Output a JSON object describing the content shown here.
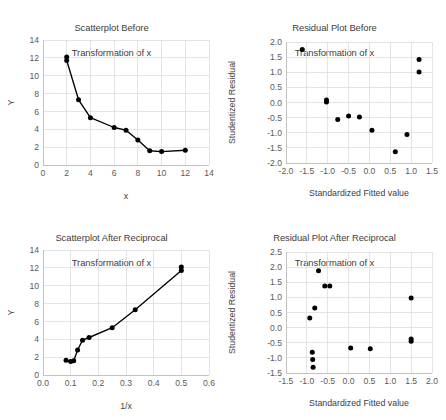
{
  "figure": {
    "width": 446,
    "height": 420,
    "background": "#ffffff",
    "marker_color": "#000000",
    "grid_color": "#d9d9d9",
    "text_color": "#404040"
  },
  "panels": {
    "top_left": {
      "title": "Scatterplot Before\nTransformation of x",
      "title_line1": "Scatterplot Before",
      "title_line2": "Transformation of x"
    },
    "top_right": {
      "title": "Residual Plot Before\nTransformation of x",
      "title_line1": "Residual Plot Before",
      "title_line2": "Transformation of x"
    },
    "bottom_left": {
      "title": "Scatterplot After Reciprocal\nTransformation of x",
      "title_line1": "Scatterplot After Reciprocal",
      "title_line2": "Transformation of x"
    },
    "bottom_right": {
      "title": "Residual Plot After Reciprocal\nTransformation of x",
      "title_line1": "Residual Plot After Reciprocal",
      "title_line2": "Transformation of x"
    }
  },
  "chart_data": [
    {
      "id": "scatterplot-before",
      "type": "line",
      "title": "Scatterplot Before Transformation of x",
      "xlabel": "x",
      "ylabel": "Y",
      "xlim": [
        0,
        14
      ],
      "ylim": [
        0,
        14
      ],
      "xticks": [
        0,
        2,
        4,
        6,
        8,
        10,
        12,
        14
      ],
      "xtick_labels": [
        "0",
        "2",
        "4",
        "6",
        "8",
        "10",
        "12",
        "14"
      ],
      "yticks": [
        0,
        2,
        4,
        6,
        8,
        10,
        12,
        14
      ],
      "ytick_labels": [
        "0",
        "2",
        "4",
        "6",
        "8",
        "10",
        "12",
        "14"
      ],
      "grid": true,
      "legend": "none",
      "markers": true,
      "connected": true,
      "x": [
        2,
        2,
        3,
        4,
        6,
        7,
        8,
        9,
        10,
        12
      ],
      "y": [
        12.1,
        11.7,
        7.3,
        5.3,
        4.2,
        3.9,
        2.8,
        1.6,
        1.5,
        1.65
      ]
    },
    {
      "id": "residual-plot-before",
      "type": "scatter",
      "title": "Residual Plot Before Transformation of x",
      "xlabel": "Standardized Fitted value",
      "ylabel": "Studentized Residual",
      "xlim": [
        -2.0,
        1.5
      ],
      "ylim": [
        -2.0,
        2.0
      ],
      "xticks": [
        -2.0,
        -1.5,
        -1.0,
        -0.5,
        0.0,
        0.5,
        1.0,
        1.5
      ],
      "xtick_labels": [
        "-2.0",
        "-1.5",
        "-1.0",
        "-0.5",
        "0.0",
        "0.5",
        "1.0",
        "1.5"
      ],
      "yticks": [
        -2.0,
        -1.5,
        -1.0,
        -0.5,
        0.0,
        0.5,
        1.0,
        1.5,
        2.0
      ],
      "ytick_labels": [
        "-2.0",
        "-1.5",
        "-1.0",
        "-0.5",
        "0.0",
        "0.5",
        "1.0",
        "1.5",
        "2.0"
      ],
      "grid": true,
      "legend": "none",
      "markers": true,
      "connected": false,
      "x": [
        -1.61,
        -1.03,
        -1.03,
        -0.76,
        -0.5,
        -0.24,
        0.06,
        0.62,
        0.9,
        1.19,
        1.19
      ],
      "y": [
        1.75,
        0.08,
        0.02,
        -0.56,
        -0.45,
        -0.48,
        -0.92,
        -1.63,
        -1.06,
        1.42,
        1.01
      ]
    },
    {
      "id": "scatterplot-after-reciprocal",
      "type": "line",
      "title": "Scatterplot After Reciprocal Transformation of x",
      "xlabel": "1/x",
      "ylabel": "Y",
      "xlim": [
        0.0,
        0.6
      ],
      "ylim": [
        0,
        14
      ],
      "xticks": [
        0.0,
        0.1,
        0.2,
        0.3,
        0.4,
        0.5,
        0.6
      ],
      "xtick_labels": [
        "0.0",
        "0.1",
        "0.2",
        "0.3",
        "0.4",
        "0.5",
        "0.6"
      ],
      "yticks": [
        0,
        2,
        4,
        6,
        8,
        10,
        12,
        14
      ],
      "ytick_labels": [
        "0",
        "2",
        "4",
        "6",
        "8",
        "10",
        "12",
        "14"
      ],
      "grid": true,
      "legend": "none",
      "markers": true,
      "connected": true,
      "x": [
        0.0833,
        0.1,
        0.1111,
        0.125,
        0.1429,
        0.1667,
        0.25,
        0.3333,
        0.5,
        0.5
      ],
      "y": [
        1.65,
        1.5,
        1.6,
        2.8,
        3.9,
        4.2,
        5.3,
        7.3,
        11.7,
        12.1
      ]
    },
    {
      "id": "residual-plot-after-reciprocal",
      "type": "scatter",
      "title": "Residual Plot After Reciprocal Transformation of x",
      "xlabel": "Standardized Fitted value",
      "ylabel": "Studentized Residual",
      "xlim": [
        -1.5,
        2.0
      ],
      "ylim": [
        -1.5,
        2.5
      ],
      "xticks": [
        -1.5,
        -1.0,
        -0.5,
        0.0,
        0.5,
        1.0,
        1.5,
        2.0
      ],
      "xtick_labels": [
        "-1.5",
        "-1.0",
        "-0.5",
        "0.0",
        "0.5",
        "1.0",
        "1.5",
        "2.0"
      ],
      "yticks": [
        -1.5,
        -1.0,
        -0.5,
        0.0,
        0.5,
        1.0,
        1.5,
        2.0,
        2.5
      ],
      "ytick_labels": [
        "-1.5",
        "-1.0",
        "-0.5",
        "0.0",
        "0.5",
        "1.0",
        "1.5",
        "2.0",
        "2.5"
      ],
      "grid": true,
      "legend": "none",
      "markers": true,
      "connected": false,
      "x": [
        -0.93,
        -0.87,
        -0.86,
        -0.85,
        -0.81,
        -0.72,
        -0.57,
        -0.45,
        0.05,
        0.52,
        1.5,
        1.5,
        1.5
      ],
      "y": [
        0.32,
        -0.81,
        -1.05,
        -1.31,
        0.65,
        1.88,
        1.38,
        1.38,
        -0.67,
        -0.7,
        0.98,
        -0.38,
        -0.45
      ]
    }
  ]
}
